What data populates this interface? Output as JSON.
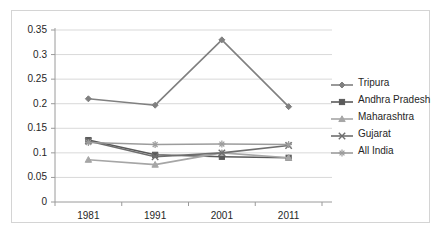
{
  "chart_data": {
    "type": "line",
    "title": "",
    "subtitle": "",
    "xlabel": "",
    "ylabel": "",
    "categories": [
      "1981",
      "1991",
      "2001",
      "2011"
    ],
    "ylim": [
      0,
      0.35
    ],
    "yticks": [
      "0",
      "0.05",
      "0.1",
      "0.15",
      "0.2",
      "0.25",
      "0.3",
      "0.35"
    ],
    "ytick_values": [
      0,
      0.05,
      0.1,
      0.15,
      0.2,
      0.25,
      0.3,
      0.35
    ],
    "grid": true,
    "legend_position": "right",
    "series": [
      {
        "name": "Tripura",
        "marker": "diamond",
        "color": "#808080",
        "values": [
          0.21,
          0.197,
          0.33,
          0.194
        ]
      },
      {
        "name": "Andhra Pradesh",
        "marker": "square",
        "color": "#5a5a5a",
        "values": [
          0.126,
          0.096,
          0.092,
          0.09
        ]
      },
      {
        "name": "Maharashtra",
        "marker": "triangle",
        "color": "#a6a6a6",
        "values": [
          0.086,
          0.076,
          0.1,
          0.09
        ]
      },
      {
        "name": "Gujarat",
        "marker": "cross",
        "color": "#6e6e6e",
        "values": [
          0.124,
          0.092,
          0.1,
          0.115
        ]
      },
      {
        "name": "All India",
        "marker": "star",
        "color": "#9c9c9c",
        "values": [
          0.121,
          0.117,
          0.118,
          0.117
        ]
      }
    ]
  },
  "legend": {
    "items": [
      {
        "label": "Tripura"
      },
      {
        "label": "Andhra Pradesh"
      },
      {
        "label": "Maharashtra"
      },
      {
        "label": "Gujarat"
      },
      {
        "label": "All India"
      }
    ]
  },
  "colors": {
    "frame_border": "#d4d4d4",
    "gridline": "#d9d9d9",
    "axis": "#9a9a9a",
    "tick_text": "#262626",
    "background": "#ffffff"
  }
}
